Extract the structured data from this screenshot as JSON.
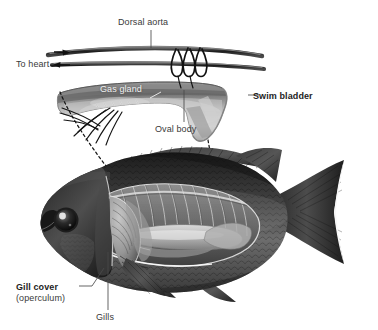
{
  "figure": {
    "background_color": "#ffffff",
    "label_color": "#3a3a3a",
    "bold_label_color": "#1d1d1d",
    "light_label_color": "#f2f2f2"
  },
  "labels": {
    "dorsal_aorta": "Dorsal aorta",
    "to_heart": "To heart",
    "gas_gland": "Gas gland",
    "swim_bladder": "Swim bladder",
    "oval_body": "Oval body",
    "gill_cover": "Gill cover",
    "operculum": "(operculum)",
    "gills": "Gills"
  },
  "panels": {
    "top": {
      "name": "swim-bladder-detail",
      "parts": [
        "dorsal aorta",
        "to heart vessel",
        "rete mirabile capillaries",
        "gas gland",
        "oval body",
        "swim bladder"
      ]
    },
    "bottom": {
      "name": "whole-fish-cutaway",
      "parts": [
        "head",
        "eye",
        "gill cover",
        "gills",
        "body cavity",
        "swim bladder",
        "ribs",
        "dorsal fin",
        "pectoral fin",
        "pelvic fin",
        "anal fin",
        "caudal fin"
      ]
    }
  }
}
